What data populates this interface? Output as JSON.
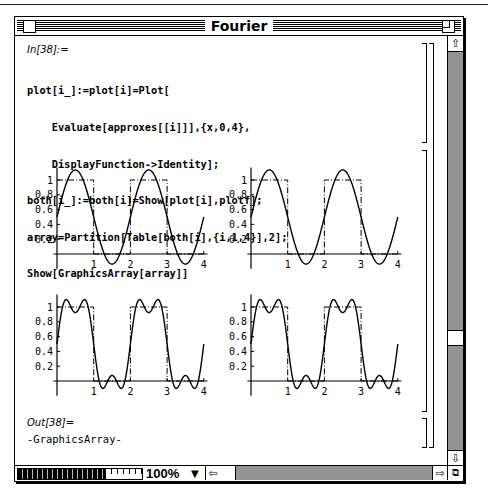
{
  "window": {
    "title": "Fourier"
  },
  "notebook": {
    "input_label": "In[38]:=",
    "input_code": [
      "plot[i_]:=plot[i]=Plot[",
      "    Evaluate[approxes[[i]]],{x,0,4},",
      "    DisplayFunction->Identity];",
      "both[i_]:=both[i]=Show[plot[i],plotf];",
      "array=Partition[Table[both[i],{i,1,4}],2];",
      "Show[GraphicsArray[array]]"
    ],
    "output_label": "Out[38]=",
    "output_value": "-GraphicsArray-"
  },
  "statusbar": {
    "zoom_level": "100%",
    "zoom_dropdown_icon": "triangle-down-icon"
  },
  "chart_data": [
    {
      "type": "line",
      "title": "",
      "position": "top-left",
      "xlabel": "",
      "ylabel": "",
      "x_ticks": [
        "1",
        "2",
        "3",
        "4"
      ],
      "y_ticks": [
        "0.2",
        "0.4",
        "0.6",
        "0.8",
        "1"
      ],
      "xlim": [
        0,
        4
      ],
      "ylim": [
        -0.15,
        1.15
      ],
      "grid": false,
      "series": [
        {
          "name": "approximation (1 term)",
          "style": "solid",
          "formula": "0.5 + (2/pi) sin(pi x)"
        },
        {
          "name": "square wave",
          "style": "dash-dot",
          "values": [
            [
              0,
              1
            ],
            [
              1,
              1
            ],
            [
              1,
              0
            ],
            [
              2,
              0
            ],
            [
              2,
              1
            ],
            [
              3,
              1
            ],
            [
              3,
              0
            ],
            [
              4,
              0
            ]
          ]
        }
      ]
    },
    {
      "type": "line",
      "title": "",
      "position": "top-right",
      "xlabel": "",
      "ylabel": "",
      "x_ticks": [
        "1",
        "2",
        "3",
        "4"
      ],
      "y_ticks": [
        "0.2",
        "0.4",
        "0.6",
        "0.8",
        "1"
      ],
      "xlim": [
        0,
        4
      ],
      "ylim": [
        -0.15,
        1.15
      ],
      "grid": false,
      "series": [
        {
          "name": "approximation (2 terms)",
          "style": "solid",
          "formula": "0.5 + (2/pi) sin(pi x)"
        },
        {
          "name": "square wave",
          "style": "dash-dot",
          "values": [
            [
              0,
              1
            ],
            [
              1,
              1
            ],
            [
              1,
              0
            ],
            [
              2,
              0
            ],
            [
              2,
              1
            ],
            [
              3,
              1
            ],
            [
              3,
              0
            ],
            [
              4,
              0
            ]
          ]
        }
      ]
    },
    {
      "type": "line",
      "title": "",
      "position": "bottom-left",
      "xlabel": "",
      "ylabel": "",
      "x_ticks": [
        "1",
        "2",
        "3",
        "4"
      ],
      "y_ticks": [
        "0.2",
        "0.4",
        "0.6",
        "0.8",
        "1"
      ],
      "xlim": [
        0,
        4
      ],
      "ylim": [
        -0.15,
        1.15
      ],
      "grid": false,
      "series": [
        {
          "name": "approximation (3 terms)",
          "style": "solid",
          "formula": "0.5 + (2/pi)(sin(pi x) + sin(3 pi x)/3)"
        },
        {
          "name": "square wave",
          "style": "dash-dot",
          "values": [
            [
              0,
              1
            ],
            [
              1,
              1
            ],
            [
              1,
              0
            ],
            [
              2,
              0
            ],
            [
              2,
              1
            ],
            [
              3,
              1
            ],
            [
              3,
              0
            ],
            [
              4,
              0
            ]
          ]
        }
      ]
    },
    {
      "type": "line",
      "title": "",
      "position": "bottom-right",
      "xlabel": "",
      "ylabel": "",
      "x_ticks": [
        "1",
        "2",
        "3",
        "4"
      ],
      "y_ticks": [
        "0.2",
        "0.4",
        "0.6",
        "0.8",
        "1"
      ],
      "xlim": [
        0,
        4
      ],
      "ylim": [
        -0.15,
        1.15
      ],
      "grid": false,
      "series": [
        {
          "name": "approximation (4 terms)",
          "style": "solid",
          "formula": "0.5 + (2/pi)(sin(pi x) + sin(3 pi x)/3)"
        },
        {
          "name": "square wave",
          "style": "dash-dot",
          "values": [
            [
              0,
              1
            ],
            [
              1,
              1
            ],
            [
              1,
              0
            ],
            [
              2,
              0
            ],
            [
              2,
              1
            ],
            [
              3,
              1
            ],
            [
              3,
              0
            ],
            [
              4,
              0
            ]
          ]
        }
      ]
    }
  ]
}
